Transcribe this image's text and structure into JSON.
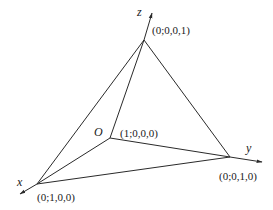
{
  "diagram": {
    "type": "simplex-tetrahedron",
    "axes": {
      "x": {
        "label": "x"
      },
      "y": {
        "label": "y"
      },
      "z": {
        "label": "z"
      }
    },
    "origin": {
      "label": "O"
    },
    "vertices": [
      {
        "id": "origin",
        "label": "(1;0,0,0)"
      },
      {
        "id": "x",
        "label": "(0;1,0,0)"
      },
      {
        "id": "y",
        "label": "(0;0,1,0)"
      },
      {
        "id": "z",
        "label": "(0;0,0,1)"
      }
    ],
    "edges": [
      [
        "origin",
        "x"
      ],
      [
        "origin",
        "y"
      ],
      [
        "origin",
        "z"
      ],
      [
        "x",
        "y"
      ],
      [
        "x",
        "z"
      ],
      [
        "y",
        "z"
      ]
    ],
    "colors": {
      "stroke": "#2a2a2a",
      "text": "#1a1a1a",
      "background": "#ffffff"
    }
  }
}
